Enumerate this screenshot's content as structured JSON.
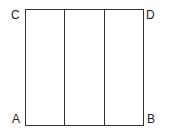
{
  "diagram": {
    "labels": {
      "top_left": "C",
      "top_right": "D",
      "bottom_left": "A",
      "bottom_right": "B"
    },
    "square": {
      "x": 25,
      "y": 9,
      "width": 118,
      "height": 116
    },
    "dividers_x": [
      64,
      104
    ],
    "line_color": "#333333"
  }
}
